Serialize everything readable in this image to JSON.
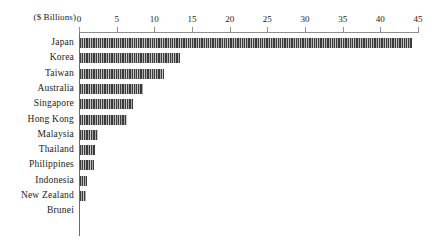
{
  "chart_data": {
    "type": "bar",
    "orientation": "horizontal",
    "title": "",
    "subtitle": "",
    "unit_caption": "($ Billions)",
    "xlabel": "",
    "ylabel": "",
    "xlim": [
      0,
      45
    ],
    "xticks": [
      0,
      5,
      10,
      15,
      20,
      25,
      30,
      35,
      40,
      45
    ],
    "xtick_labels": [
      "0",
      "5",
      "10",
      "15",
      "20",
      "25",
      "30",
      "35",
      "40",
      "45"
    ],
    "grid": false,
    "legend": null,
    "axis_position": "top",
    "bar_fill_color": "#3b3b3b",
    "bar_pattern": "vertical-hatch",
    "axis_color": "#8f8f8f",
    "categories": [
      "Japan",
      "Korea",
      "Taiwan",
      "Australia",
      "Singapore",
      "Hong Kong",
      "Malaysia",
      "Thailand",
      "Philippines",
      "Indonesia",
      "New Zealand",
      "Brunei"
    ],
    "values": [
      44.1,
      13.3,
      11.2,
      8.3,
      7.1,
      6.3,
      2.4,
      2.0,
      1.9,
      0.9,
      0.8,
      0.0
    ]
  }
}
